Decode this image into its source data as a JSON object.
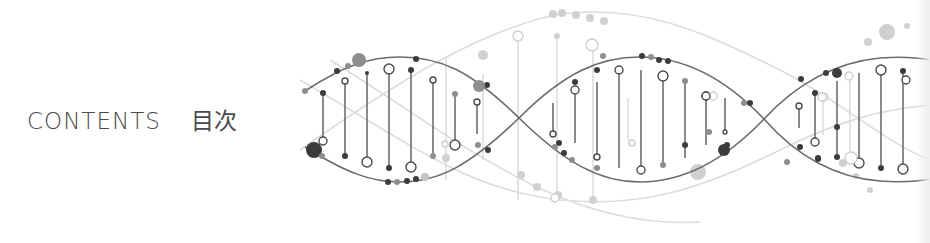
{
  "heading": {
    "english": "CONTENTS",
    "japanese": "目次"
  },
  "decoration": {
    "icon": "dna-helix-icon",
    "strand_color": "#6b6b6b",
    "faint_strand_color": "#d6d6d6",
    "dark_node_color": "#3a3a3a",
    "mid_node_color": "#8c8c8c",
    "light_node_color": "#cfcfcf"
  }
}
